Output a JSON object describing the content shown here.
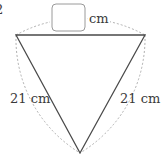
{
  "diagram": {
    "type": "equilateral-triangle-with-arcs",
    "question_fragment": "2",
    "top_side": {
      "answer_box": "",
      "unit": "cm"
    },
    "left_side": {
      "label": "21 cm"
    },
    "right_side": {
      "label": "21 cm"
    },
    "colors": {
      "triangle_stroke": "#4a4a4a",
      "arc_stroke": "#b0b0b0",
      "box_stroke": "#9a9a9a",
      "text": "#3a3a3a"
    }
  }
}
